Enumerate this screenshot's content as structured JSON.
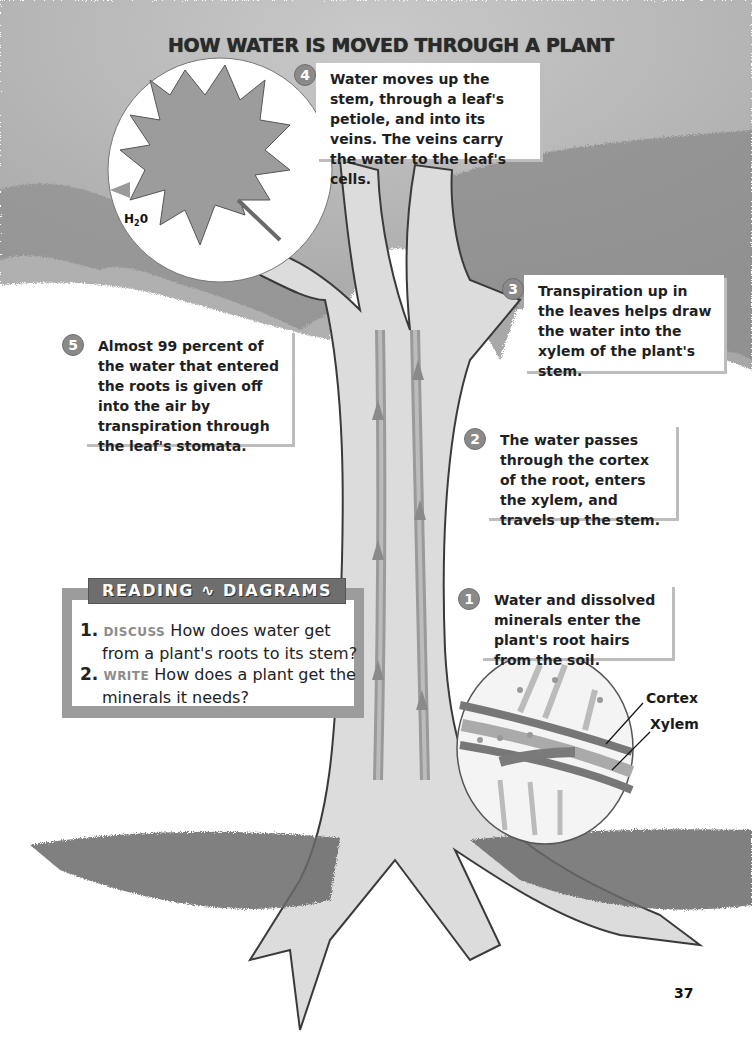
{
  "page": {
    "title": "HOW WATER IS MOVED THROUGH A PLANT",
    "page_number": "37"
  },
  "steps": [
    {
      "number": "1",
      "text": "Water and dissolved minerals enter the plant's root hairs from the soil."
    },
    {
      "number": "2",
      "text": "The water passes through the cortex of the root, enters the xylem, and travels up the stem."
    },
    {
      "number": "3",
      "text": "Transpiration up in the leaves helps draw the water into the xylem of the plant's stem."
    },
    {
      "number": "4",
      "text": "Water moves up the stem, through a leaf's petiole, and into its veins. The veins carry the water to the leaf's cells."
    },
    {
      "number": "5",
      "text": "Almost 99 percent of the water that entered the roots is given off into the air by transpiration through the leaf's stomata."
    }
  ],
  "leaf_inset": {
    "label_main": "H",
    "label_sub": "2",
    "label_end": "0"
  },
  "root_inset": {
    "labels": [
      "Cortex",
      "Xylem"
    ]
  },
  "reading_diagrams": {
    "heading_left": "READING",
    "heading_right": "DIAGRAMS",
    "questions": [
      {
        "num": "1.",
        "keyword": "DISCUSS",
        "line1": "How does water get",
        "line2": "from a plant's roots to its stem?"
      },
      {
        "num": "2.",
        "keyword": "WRITE",
        "line1": "How does a plant get the",
        "line2": "minerals it needs?"
      }
    ]
  },
  "colors": {
    "callout_number_bg": "#8a8a8a",
    "reading_border": "#9c9c9c",
    "reading_tab": "#6e6e6e",
    "keyword": "#8c8c8c",
    "canopy": "#9a9a9a",
    "soil": "#6a6a6a"
  }
}
